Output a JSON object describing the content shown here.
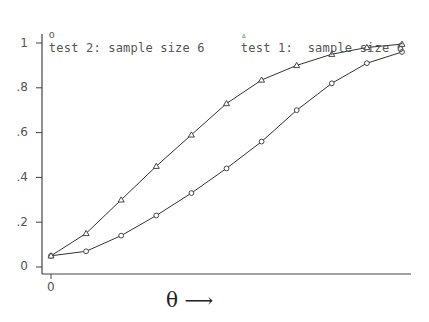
{
  "legend": {
    "series2_marker": "o",
    "series2_label": "test 2: sample size 6",
    "series1_marker": "▵",
    "series1_label": "test 1:  sample size 6"
  },
  "axes": {
    "xlabel": "θ ⟶",
    "yticks": [
      "1",
      ".8",
      ".6",
      ".4",
      ".2",
      "0"
    ],
    "xticks": [
      "0"
    ]
  },
  "colors": {
    "line": "#333333",
    "axis": "#444444",
    "text": "#555555"
  },
  "chart_data": {
    "type": "line",
    "title": "",
    "xlabel": "θ",
    "ylabel": "",
    "ylim": [
      0,
      1
    ],
    "grid": false,
    "legend_position": "top",
    "x": [
      0,
      1,
      2,
      3,
      4,
      5,
      6,
      7,
      8,
      9,
      10
    ],
    "series": [
      {
        "name": "test 2: sample size 6",
        "marker": "circle",
        "values": [
          0.05,
          0.07,
          0.14,
          0.23,
          0.33,
          0.44,
          0.56,
          0.7,
          0.82,
          0.91,
          0.96
        ]
      },
      {
        "name": "test 1: sample size 6",
        "marker": "triangle",
        "values": [
          0.05,
          0.15,
          0.3,
          0.45,
          0.59,
          0.73,
          0.835,
          0.9,
          0.95,
          0.98,
          0.995
        ]
      }
    ]
  }
}
